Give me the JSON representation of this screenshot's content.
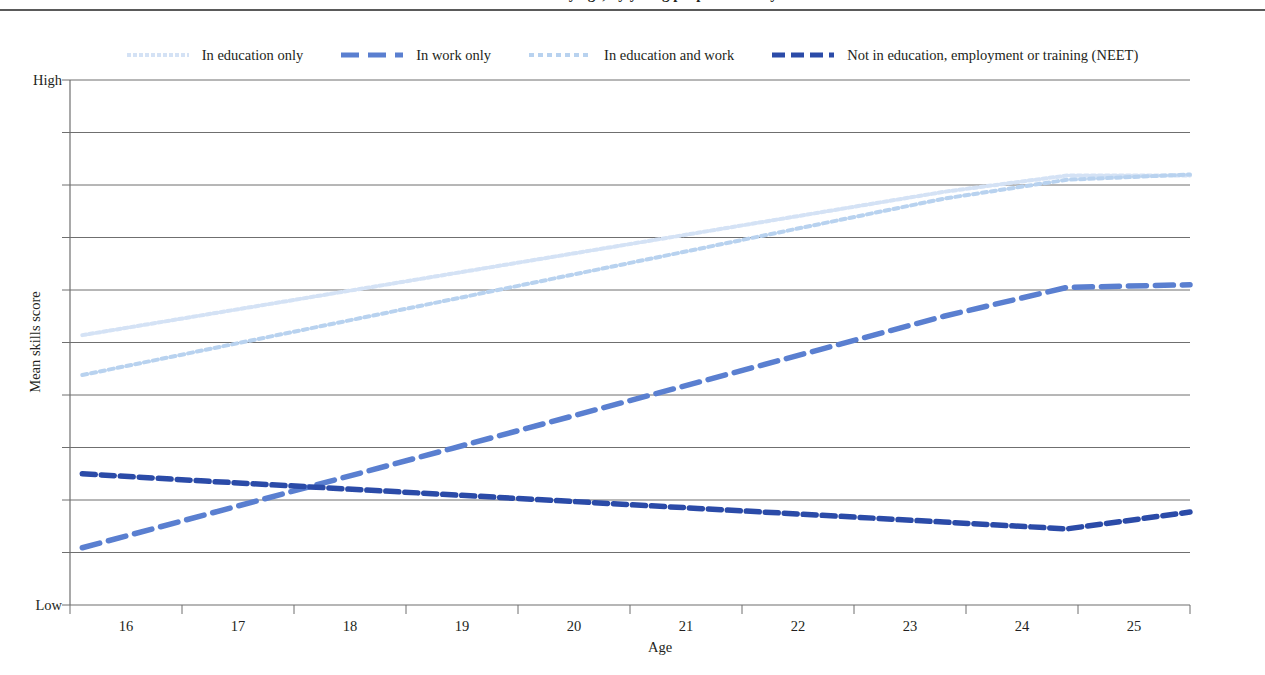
{
  "page": {
    "title_partial": "Mean skills score by age, by young people's activity status",
    "background_color": "#ffffff"
  },
  "legend": {
    "position": "top-center",
    "items": [
      {
        "label": "In education only",
        "color": "#d4e2f5",
        "dash": "fine-dotted",
        "key": "edu_only"
      },
      {
        "label": "In work only",
        "color": "#5a7fd0",
        "dash": "long-dash",
        "key": "work_only"
      },
      {
        "label": "In education and work",
        "color": "#b8d2ef",
        "dash": "dotted",
        "key": "edu_and_work"
      },
      {
        "label": "Not in education, employment or training (NEET)",
        "color": "#2b4ba8",
        "dash": "dash",
        "key": "neet"
      }
    ]
  },
  "axes": {
    "y": {
      "title": "Mean skills score",
      "top_label": "High",
      "bottom_label": "Low",
      "gridlines": 11,
      "grid_visible": true
    },
    "x": {
      "title": "Age",
      "tick_labels": [
        "16",
        "17",
        "18",
        "19",
        "20",
        "21",
        "22",
        "23",
        "24",
        "25"
      ]
    }
  },
  "chart_data": {
    "type": "line",
    "title": "Mean skills score by age, by young people's activity status",
    "xlabel": "Age",
    "ylabel": "Mean skills score",
    "x": [
      16,
      17,
      18,
      19,
      20,
      21,
      22,
      23,
      24,
      25
    ],
    "xlim": [
      15.9,
      25.0
    ],
    "ylim": [
      0,
      100
    ],
    "ylim_labels": [
      "Low",
      "High"
    ],
    "grid": true,
    "legend_position": "top",
    "series": [
      {
        "name": "In education only",
        "color": "#d4e2f5",
        "dash": "fine-dotted",
        "values": [
          51.4,
          55.3,
          59.2,
          63.1,
          67.0,
          70.9,
          74.8,
          78.7,
          81.8,
          81.8
        ]
      },
      {
        "name": "In work only",
        "color": "#5a7fd0",
        "dash": "long-dash",
        "values": [
          10.9,
          17.2,
          23.5,
          29.8,
          36.1,
          42.4,
          48.7,
          55.0,
          60.5,
          61.0
        ]
      },
      {
        "name": "In education and work",
        "color": "#b8d2ef",
        "dash": "dotted",
        "values": [
          43.8,
          48.6,
          53.4,
          58.2,
          63.0,
          67.8,
          72.6,
          77.4,
          81.0,
          82.0
        ]
      },
      {
        "name": "Not in education, employment or training (NEET)",
        "color": "#2b4ba8",
        "dash": "dash",
        "values": [
          25.0,
          23.6,
          22.3,
          21.0,
          19.7,
          18.4,
          17.1,
          15.8,
          14.5,
          17.7
        ]
      }
    ]
  }
}
